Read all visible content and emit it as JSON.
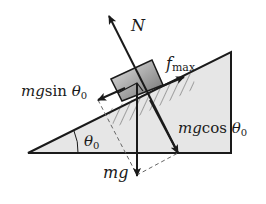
{
  "diagram": {
    "labels": {
      "normal_force": "N",
      "friction_f": "f",
      "friction_sub": "max",
      "parallel_mg": "mg",
      "parallel_func": "sin ",
      "parallel_theta": "θ",
      "parallel_sub": "0",
      "perp_mg": "mg",
      "perp_func": "cos ",
      "perp_theta": "θ",
      "perp_sub": "0",
      "weight": "mg",
      "angle_theta": "θ",
      "angle_sub": "0"
    },
    "colors": {
      "incline_fill": "#e6e6e6",
      "line": "#1a1a1a",
      "block_light": "#d6d6d6",
      "block_dark": "#7a7a7a",
      "dashed": "#666666"
    }
  }
}
